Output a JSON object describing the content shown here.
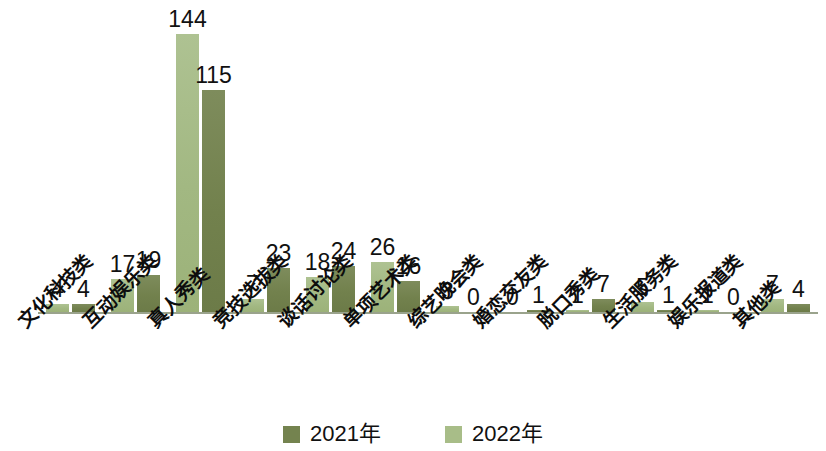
{
  "chart_data": {
    "type": "bar",
    "title": "",
    "subtitle": "",
    "xlabel": "",
    "ylabel": "",
    "ylim": [
      0,
      160
    ],
    "grid": false,
    "legend_position": "bottom",
    "axis_baseline_color": "#9aa38c",
    "categories": [
      "文化科技类",
      "互动娱乐类",
      "真人秀类",
      "竞技选拔类",
      "谈话讨论类",
      "单项艺术类",
      "综艺晚会类",
      "婚恋交友类",
      "脱口秀类",
      "生活服务类",
      "娱乐报道类",
      "其他类"
    ],
    "series": [
      {
        "name": "2022年",
        "color": "#a8bd88",
        "order": 1,
        "values": [
          4,
          17,
          144,
          7,
          18,
          26,
          3,
          0,
          1,
          5,
          1,
          7
        ]
      },
      {
        "name": "2021年",
        "color": "#74834f",
        "order": 2,
        "values": [
          4,
          19,
          115,
          23,
          24,
          16,
          0,
          1,
          7,
          1,
          0,
          4
        ]
      }
    ]
  },
  "legend": {
    "items": [
      {
        "label": "2021年",
        "swatch": "dark"
      },
      {
        "label": "2022年",
        "swatch": "light"
      }
    ]
  }
}
